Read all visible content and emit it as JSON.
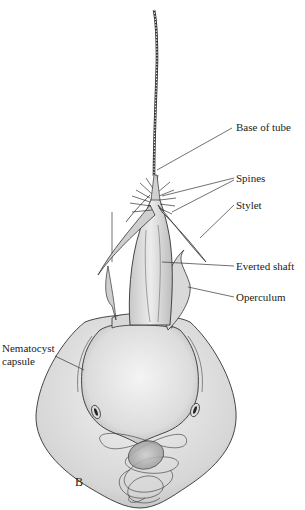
{
  "figure": {
    "panel_letter": "B",
    "labels": [
      {
        "id": "base-of-tube",
        "text": "Base of tube"
      },
      {
        "id": "spines",
        "text": "Spines"
      },
      {
        "id": "stylet",
        "text": "Stylet"
      },
      {
        "id": "everted-shaft",
        "text": "Everted shaft"
      },
      {
        "id": "operculum",
        "text": "Operculum"
      },
      {
        "id": "nematocyst-capsule",
        "text": "Nematocyst\ncapsule"
      }
    ],
    "colors": {
      "background": "#ffffff",
      "ink": "#2a2a2a",
      "stipple": "#9a9a9a"
    }
  }
}
